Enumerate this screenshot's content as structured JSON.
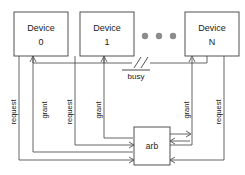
{
  "diagram": {
    "devices": [
      {
        "name": "device-0",
        "line1": "Device",
        "line2": "0"
      },
      {
        "name": "device-1",
        "line1": "Device",
        "line2": "1"
      },
      {
        "name": "device-n",
        "line1": "Device",
        "line2": "N"
      }
    ],
    "ellipsis": "● ● ●",
    "arbiter": {
      "label": "arb"
    },
    "bus": {
      "label": "busy",
      "active_low": true,
      "break_mark": "//"
    },
    "signals": [
      {
        "name": "request-device-0",
        "label": "request"
      },
      {
        "name": "grant-device-0",
        "label": "grant"
      },
      {
        "name": "request-device-1",
        "label": "request"
      },
      {
        "name": "grant-device-1",
        "label": "grant"
      },
      {
        "name": "grant-device-n",
        "label": "grant"
      },
      {
        "name": "request-device-n",
        "label": "request"
      }
    ],
    "colors": {
      "wire": "#3f3f3f",
      "text": "#1a1a1a",
      "dot": "#8c8c8c",
      "background": "#ffffff"
    }
  }
}
